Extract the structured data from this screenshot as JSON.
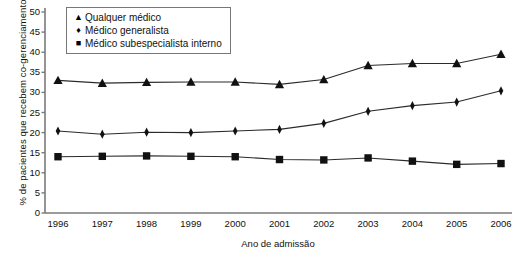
{
  "chart_data": {
    "type": "line",
    "title": "",
    "xlabel": "Ano de admissão",
    "ylabel": "% de pacientes que recebem co-gerenciamento",
    "categories": [
      "1996",
      "1997",
      "1998",
      "1999",
      "2000",
      "2001",
      "2002",
      "2003",
      "2004",
      "2005",
      "2006"
    ],
    "x": [
      1996,
      1997,
      1998,
      1999,
      2000,
      2001,
      2002,
      2003,
      2004,
      2005,
      2006
    ],
    "xlim": [
      1995.5,
      2006.5
    ],
    "ylim": [
      0,
      50
    ],
    "yticks": [
      0,
      5,
      10,
      15,
      20,
      25,
      30,
      35,
      40,
      45,
      50
    ],
    "ytick_labels": [
      "0",
      "5",
      "10",
      "15",
      "20",
      "25",
      "30",
      "35",
      "40",
      "45",
      "50"
    ],
    "grid": false,
    "legend_position": "top-left",
    "series": [
      {
        "name": "Qualquer médico",
        "marker": "triangle",
        "values": [
          33.0,
          32.3,
          32.5,
          32.6,
          32.6,
          32.0,
          33.2,
          36.7,
          37.2,
          37.2,
          39.5
        ]
      },
      {
        "name": "Médico generalista",
        "marker": "diamond",
        "values": [
          20.4,
          19.6,
          20.1,
          20.0,
          20.4,
          20.8,
          22.3,
          25.3,
          26.7,
          27.6,
          30.4
        ]
      },
      {
        "name": "Médico subespecialista interno",
        "marker": "square",
        "values": [
          14.0,
          14.1,
          14.2,
          14.1,
          14.0,
          13.3,
          13.2,
          13.7,
          12.9,
          12.1,
          12.3
        ]
      }
    ]
  },
  "axis": {
    "ylabel": "% de pacientes que recebem co-gerenciamento",
    "xlabel": "Ano de admissão"
  },
  "legend": {
    "items": [
      {
        "marker_glyph": "▲",
        "label": "Qualquer médico"
      },
      {
        "marker_glyph": "♦",
        "label": "Médico generalista"
      },
      {
        "marker_glyph": "■",
        "label": "Médico subespecialista interno"
      }
    ]
  },
  "colors": {
    "line": "#2b2b2b",
    "marker": "#111111",
    "axis": "#7a7a7a",
    "text": "#111111",
    "background": "#ffffff"
  }
}
